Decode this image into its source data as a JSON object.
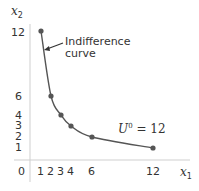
{
  "chart_data": {
    "type": "line",
    "title": "",
    "xlabel": "x1",
    "ylabel": "x2",
    "xlim": [
      0,
      13.5
    ],
    "ylim": [
      0,
      13.5
    ],
    "grid": false,
    "x_ticks": [
      "0",
      "1",
      "2",
      "3",
      "4",
      "6",
      "12"
    ],
    "y_ticks": [
      "1",
      "2",
      "3",
      "4",
      "6",
      "12"
    ],
    "series": [
      {
        "name": "Indifference curve U0 = 12",
        "x": [
          1,
          2,
          3,
          4,
          6,
          12
        ],
        "y": [
          12,
          6,
          4,
          3,
          2,
          1
        ],
        "markers": true
      }
    ],
    "annotations": [
      {
        "text": "Indifference curve",
        "points_to": "curve near (1.3, 9)"
      },
      {
        "text": "U0 = 12",
        "position": "above curve near x=8"
      }
    ],
    "colors": {
      "curve": "#555555",
      "axis": "#c8c8c8",
      "text": "#333333"
    }
  },
  "labels": {
    "y_axis_var": "x",
    "y_axis_sub": "2",
    "x_axis_var": "x",
    "x_axis_sub": "1",
    "annotation_line1": "Indifference",
    "annotation_line2": "curve",
    "u_letter": "U",
    "u_sup": "0",
    "u_rest": " = 12",
    "origin": "0",
    "x_ticks": [
      "1",
      "2",
      "3",
      "4",
      "6",
      "12"
    ],
    "y_ticks": [
      "12",
      "6",
      "4",
      "3",
      "2",
      "1"
    ]
  }
}
